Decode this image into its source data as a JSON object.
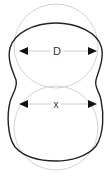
{
  "diagram": {
    "labels": {
      "top_dimension": "D",
      "bottom_dimension": "x"
    },
    "colors": {
      "outline": "#222222",
      "reference_circle": "#d4d4d4",
      "dimension_line": "#cccccc",
      "arrowhead": "#111111",
      "background": "#ffffff"
    }
  }
}
